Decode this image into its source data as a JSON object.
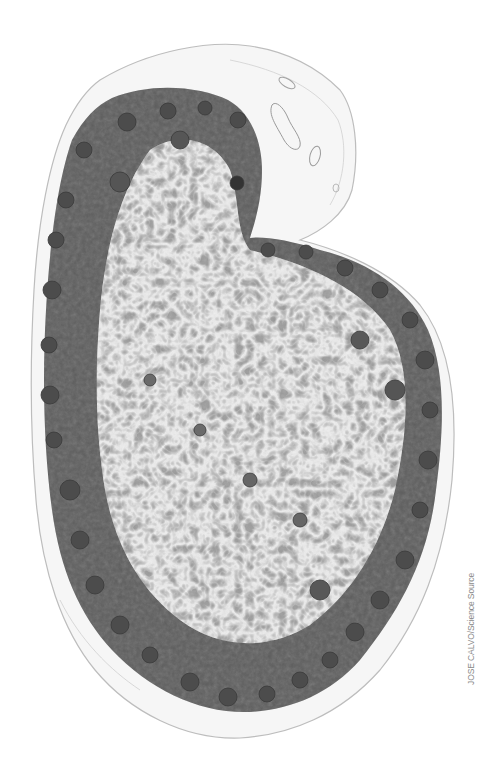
{
  "image": {
    "subject": "Lymph node tissue section (light micrograph, grayscale)",
    "background_color": "#ffffff",
    "capsule_color": "#e6e6e6",
    "cortex_color": "#5e5e5e",
    "follicle_color": "#4a4a4a",
    "medulla_color": "#a8a8a8",
    "medulla_highlight_color": "#d2d2d2"
  },
  "credit": {
    "text": "JOSE CALVO/Science Source"
  }
}
